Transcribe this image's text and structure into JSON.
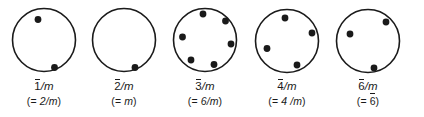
{
  "figure": {
    "background_color": "#ffffff",
    "ink_color": "#1a1a1a",
    "circle_stroke_width": 1.6,
    "dot_radius": 3.4,
    "circle_radius": 31.5
  },
  "groups": [
    {
      "id": "group-1bar-over-m",
      "symbol_bar": "1",
      "symbol_rest": "/m",
      "alt_prefix": "(= ",
      "alt_bar": "",
      "alt_rest": "2/m",
      "alt_suffix": ")",
      "center": {
        "x": 44,
        "y": 40
      },
      "dot_count": 2,
      "dots": [
        {
          "x": 38.0,
          "y": 19.5
        },
        {
          "x": 54.5,
          "y": 67.5
        }
      ]
    },
    {
      "id": "group-2bar-over-m",
      "symbol_bar": "2",
      "symbol_rest": "/m",
      "alt_prefix": "(= ",
      "alt_bar": "",
      "alt_rest": "m",
      "alt_suffix": ")",
      "center": {
        "x": 124,
        "y": 40
      },
      "dot_count": 1,
      "dots": [
        {
          "x": 135.0,
          "y": 67.5
        }
      ]
    },
    {
      "id": "group-3bar-over-m",
      "symbol_bar": "3",
      "symbol_rest": "/m",
      "alt_prefix": "(= ",
      "alt_bar": "",
      "alt_rest": "6/m",
      "alt_suffix": ")",
      "center": {
        "x": 205,
        "y": 40
      },
      "dot_count": 6,
      "dots": [
        {
          "x": 203.0,
          "y": 14.0
        },
        {
          "x": 225.5,
          "y": 21.0
        },
        {
          "x": 231.0,
          "y": 44.0
        },
        {
          "x": 214.0,
          "y": 64.5
        },
        {
          "x": 191.0,
          "y": 60.0
        },
        {
          "x": 182.5,
          "y": 37.0
        }
      ]
    },
    {
      "id": "group-4bar-over-m",
      "symbol_bar": "4",
      "symbol_rest": "/m",
      "alt_prefix": "(= ",
      "alt_bar": "",
      "alt_rest": "4 /m",
      "alt_suffix": ")",
      "center": {
        "x": 287,
        "y": 41
      },
      "dot_count": 4,
      "dots": [
        {
          "x": 285.0,
          "y": 18.0
        },
        {
          "x": 312.0,
          "y": 33.0
        },
        {
          "x": 297.0,
          "y": 65.0
        },
        {
          "x": 267.0,
          "y": 48.5
        }
      ]
    },
    {
      "id": "group-6bar-over-m",
      "symbol_bar": "6",
      "symbol_rest": "/m",
      "alt_prefix": "(= ",
      "alt_bar": "6",
      "alt_rest": "",
      "alt_suffix": ")",
      "center": {
        "x": 368,
        "y": 41
      },
      "dot_count": 3,
      "dots": [
        {
          "x": 386.0,
          "y": 22.0
        },
        {
          "x": 350.0,
          "y": 34.0
        },
        {
          "x": 374.0,
          "y": 68.0
        }
      ]
    }
  ]
}
